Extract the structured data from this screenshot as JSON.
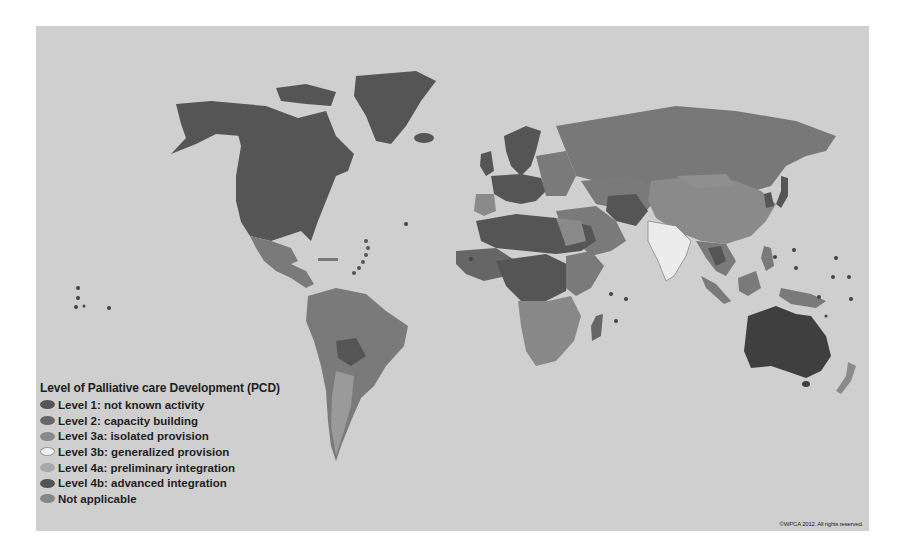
{
  "map": {
    "background_color": "#cfcfcf",
    "ocean_color": "#cfcfcf"
  },
  "legend": {
    "title": "Level of Palliative care Development (PCD)",
    "items": [
      {
        "label": "Level 1: not known activity",
        "color": "#555555"
      },
      {
        "label": "Level 2: capacity building",
        "color": "#666666"
      },
      {
        "label": "Level 3a: isolated provision",
        "color": "#8a8a8a"
      },
      {
        "label": "Level 3b: generalized provision",
        "color": "#f2f2f2"
      },
      {
        "label": "Level 4a: preliminary integration",
        "color": "#a8a8a8"
      },
      {
        "label": "Level 4b: advanced integration",
        "color": "#535353"
      },
      {
        "label": "Not applicable",
        "color": "#868686"
      }
    ]
  },
  "credit": "©WPCA 2012. All rights reserved."
}
